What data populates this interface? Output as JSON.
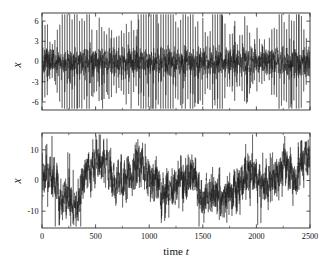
{
  "figure": {
    "background_color": "#ffffff",
    "line_color": "#1a1a1a",
    "axis_color": "#2b2b2b"
  },
  "chart_data": [
    {
      "type": "line",
      "panel": "top",
      "title": "",
      "xlabel": "",
      "ylabel": "x",
      "xlim": [
        0,
        2500
      ],
      "ylim": [
        -7.2,
        7.2
      ],
      "xticks": [
        0,
        500,
        1000,
        1500,
        2000,
        2500
      ],
      "xticklabels": [
        "",
        "",
        "",
        "",
        "",
        ""
      ],
      "yticks": [
        6,
        3,
        0,
        -3,
        -6
      ],
      "yticklabels": [
        "6",
        "3",
        "0",
        "-3",
        "-6"
      ],
      "grid": false,
      "legend": null,
      "description": "Dense spiky oscillatory time series, bursts of tall spikes reaching about +6 and -6 against a noisy core near zero, roughly periodic spike train over the whole record.",
      "seed": 20117,
      "n_points": 2500,
      "series": [
        {
          "name": "x(t) small-amplitude regime",
          "spike_amplitude": 6.0,
          "core_amplitude": 1.6,
          "spike_period": 23,
          "values_note": "generated procedurally from seed to match visual texture"
        }
      ]
    },
    {
      "type": "line",
      "panel": "bottom",
      "title": "",
      "xlabel": "time t",
      "ylabel": "x",
      "xlim": [
        0,
        2500
      ],
      "ylim": [
        -15.5,
        15.5
      ],
      "xticks": [
        0,
        500,
        1000,
        1500,
        2000,
        2500
      ],
      "xticklabels": [
        "0",
        "500",
        "1000",
        "1500",
        "2000",
        "2500"
      ],
      "yticks": [
        10,
        0,
        -10
      ],
      "yticklabels": [
        "10",
        "0",
        "-10"
      ],
      "yticks_minor": [
        5,
        -5
      ],
      "grid": false,
      "legend": null,
      "description": "Noisy random-walk-like band wandering between roughly -12 and +12, with occasional isolated spikes beyond; slow drift with high-frequency fluctuations.",
      "seed": 77041,
      "n_points": 2500,
      "series": [
        {
          "name": "x(t) large-amplitude regime",
          "band_amplitude": 7.5,
          "spike_amplitude": 13.0,
          "drift_scale": 5.0,
          "values_note": "generated procedurally from seed to match visual texture"
        }
      ]
    }
  ],
  "labels": {
    "ylabel_top": "x",
    "ylabel_bottom": "x",
    "xlabel_bottom_prefix": "time ",
    "xlabel_bottom_var": "t"
  }
}
